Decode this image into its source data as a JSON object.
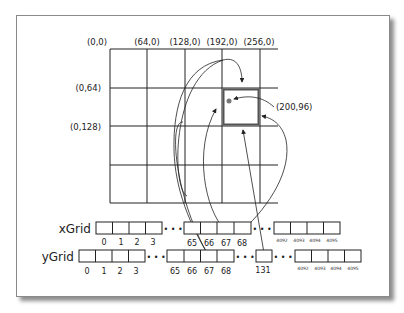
{
  "diagram": {
    "column_labels": [
      "(0,0)",
      "(64,0)",
      "(128,0)",
      "(192,0)",
      "(256,0)"
    ],
    "row_labels": [
      "(0,64)",
      "(0,128)"
    ],
    "point_label": "(200,96)",
    "highlighted_cell": {
      "col": 3,
      "row": 1
    },
    "colors": {
      "line": "#222222",
      "highlight": "#555555",
      "point": "#777777",
      "shadow": "#555555"
    },
    "arrays": [
      {
        "name": "xGrid",
        "groups": [
          {
            "indices": [
              "0",
              "1",
              "2",
              "3"
            ]
          },
          {
            "indices": [
              "65",
              "66",
              "67",
              "68"
            ]
          },
          {
            "indices": [
              "4092",
              "4093",
              "4094",
              "4095"
            ],
            "small": true
          }
        ]
      },
      {
        "name": "yGrid",
        "groups": [
          {
            "indices": [
              "0",
              "1",
              "2",
              "3"
            ]
          },
          {
            "indices": [
              "65",
              "66",
              "67",
              "68"
            ]
          },
          {
            "indices": [
              "131"
            ]
          },
          {
            "indices": [
              "4092",
              "4093",
              "4094",
              "4095"
            ],
            "small": true
          }
        ]
      }
    ],
    "ellipsis": "• • •"
  }
}
